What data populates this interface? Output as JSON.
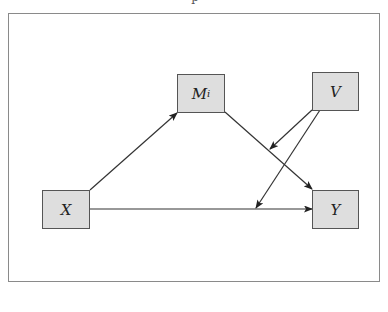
{
  "diagram": {
    "caption": "p",
    "colors": {
      "node_fill": "#dedede",
      "node_border": "#555555",
      "edge": "#222222",
      "frame": "#8a8a8a"
    },
    "nodes": [
      {
        "id": "M",
        "label": "M",
        "subscript": "i"
      },
      {
        "id": "V",
        "label": "V"
      },
      {
        "id": "X",
        "label": "X"
      },
      {
        "id": "Y",
        "label": "Y"
      }
    ],
    "edges": [
      {
        "from": "X",
        "to": "M"
      },
      {
        "from": "M",
        "to": "Y"
      },
      {
        "from": "X",
        "to": "Y"
      },
      {
        "from": "V",
        "to": "M→Y path"
      },
      {
        "from": "V",
        "to": "X→Y path"
      }
    ]
  }
}
